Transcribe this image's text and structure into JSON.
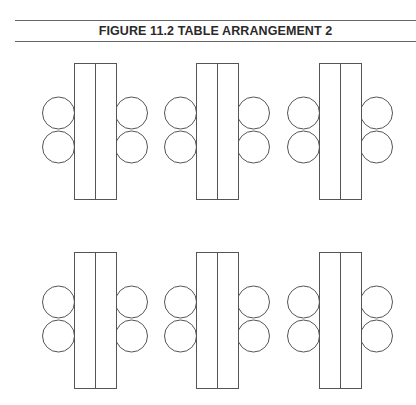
{
  "figure": {
    "title": "FIGURE 11.2  TABLE ARRANGEMENT 2"
  },
  "diagram": {
    "stroke_color": "#555555",
    "background": "#ffffff",
    "table": {
      "width": 42,
      "height": 136,
      "divided_lengthwise": true
    },
    "seat": {
      "radius": 16,
      "per_side": 2
    },
    "tables": [
      {
        "id": "table-1",
        "row": 1,
        "col": 1,
        "x": 74,
        "y": 63
      },
      {
        "id": "table-2",
        "row": 1,
        "col": 2,
        "x": 196,
        "y": 63
      },
      {
        "id": "table-3",
        "row": 1,
        "col": 3,
        "x": 319,
        "y": 63
      },
      {
        "id": "table-4",
        "row": 2,
        "col": 1,
        "x": 74,
        "y": 252
      },
      {
        "id": "table-5",
        "row": 2,
        "col": 2,
        "x": 196,
        "y": 252
      },
      {
        "id": "table-6",
        "row": 2,
        "col": 3,
        "x": 319,
        "y": 252
      }
    ],
    "seat_offsets_y": [
      50,
      84
    ]
  }
}
